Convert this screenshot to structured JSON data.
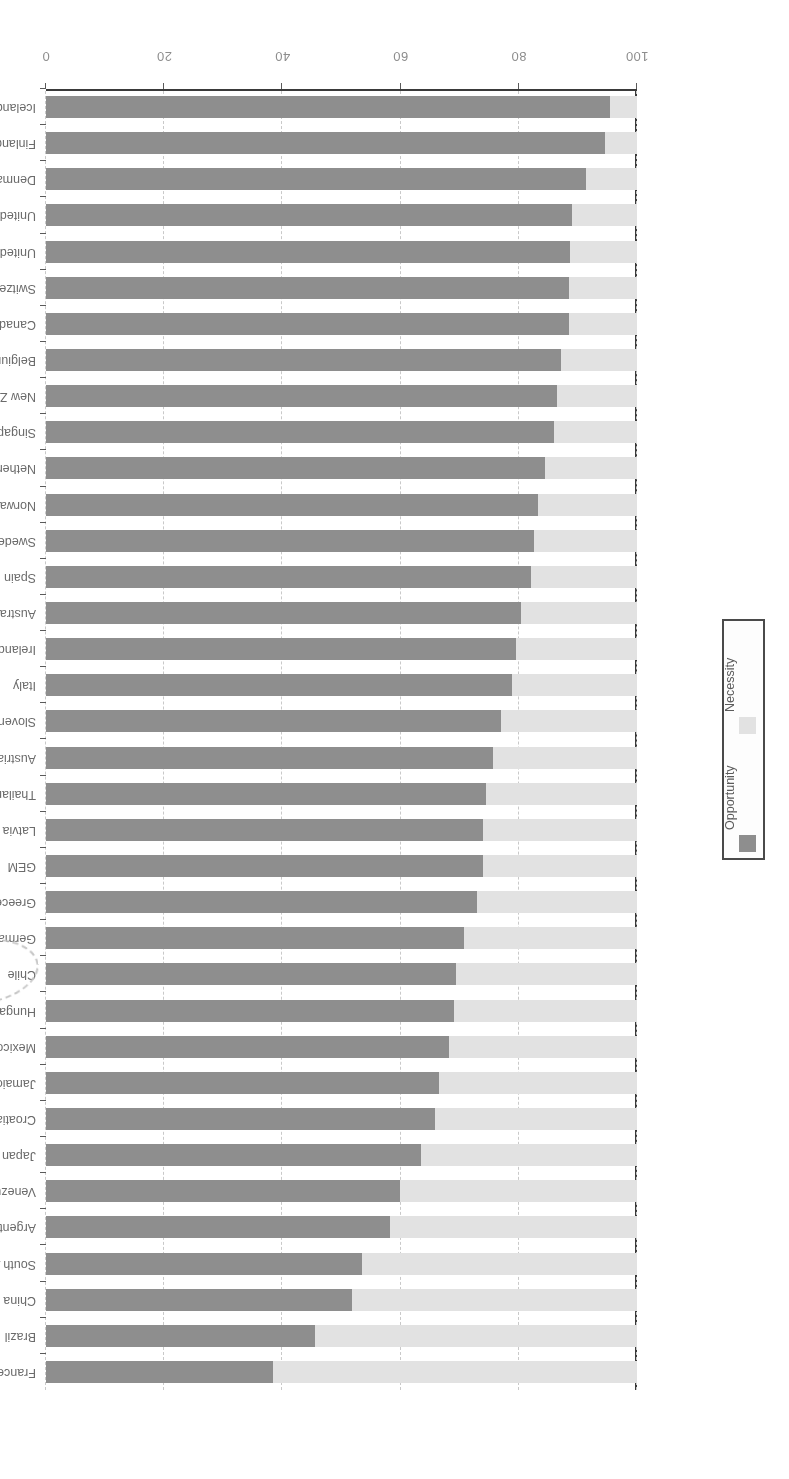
{
  "chart_data": {
    "type": "bar",
    "orientation": "horizontal",
    "stacked": true,
    "title": "",
    "subtitle": "",
    "xlabel": "",
    "ylabel": "",
    "xlim": [
      0,
      100
    ],
    "xticks": [
      "100",
      "80",
      "60",
      "40",
      "20",
      "0"
    ],
    "xtick_values": [
      100,
      80,
      60,
      40,
      20,
      0
    ],
    "x_axis_direction": "reversed",
    "grid": true,
    "grid_axis": "x",
    "legend_position": "right-middle",
    "legend": [
      {
        "name": "Opportunity",
        "color": "#8e8e8e"
      },
      {
        "name": "Necessity",
        "color": "#e2e2e2"
      }
    ],
    "categories": [
      "Iceland",
      "Finland",
      "Denmark",
      "United Kingdom",
      "United States",
      "Switzerland",
      "Canada",
      "Belgium",
      "New Zealand",
      "Singapore",
      "Netherlands",
      "Norway",
      "Sweden",
      "Spain",
      "Australia",
      "Ireland",
      "Italy",
      "Slovenia",
      "Austria",
      "Thailand",
      "Latvia",
      "GEM",
      "Greece",
      "Germany",
      "Chile",
      "Hungary",
      "Mexico",
      "Jamaica",
      "Croatia",
      "Japan",
      "Venezuela",
      "Argentina",
      "South Africa",
      "China",
      "Brazil",
      "France"
    ],
    "series": [
      {
        "name": "Opportunity",
        "color": "#8e8e8e",
        "values": [
          95.4,
          94.6,
          91.3,
          89.0,
          88.7,
          88.5,
          88.5,
          87.2,
          86.5,
          86.0,
          84.5,
          83.2,
          82.5,
          82.0,
          80.3,
          79.5,
          78.8,
          77.0,
          75.6,
          74.5,
          74.0,
          74.0,
          73.0,
          70.8,
          69.4,
          69.0,
          68.2,
          66.5,
          65.8,
          63.4,
          59.9,
          58.2,
          53.4,
          51.7,
          45.5,
          38.4
        ]
      },
      {
        "name": "Necessity",
        "color": "#e2e2e2",
        "values": [
          4.6,
          5.4,
          8.7,
          11.0,
          11.3,
          11.5,
          11.5,
          12.8,
          13.5,
          14.0,
          15.5,
          16.8,
          17.5,
          18.0,
          19.7,
          20.5,
          21.2,
          23.0,
          24.4,
          25.5,
          26.0,
          26.0,
          27.0,
          29.2,
          30.6,
          31.0,
          31.8,
          33.5,
          34.2,
          36.6,
          40.1,
          41.8,
          46.6,
          48.3,
          54.5,
          61.6
        ]
      }
    ],
    "annotations": [
      {
        "type": "hand-drawn-ellipse",
        "target": "Chile",
        "color": "#c6c6c6",
        "style": "dashed"
      }
    ],
    "page_orientation": "upside-down"
  }
}
